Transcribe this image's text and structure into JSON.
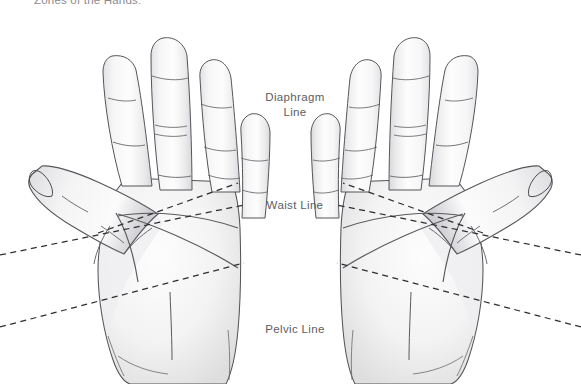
{
  "figure": {
    "caption": "Zones of the Hands:",
    "background_color": "#ffffff",
    "width": 581,
    "height": 384
  },
  "labels": {
    "diaphragm": {
      "line1": "Diaphragm",
      "line2": "Line"
    },
    "waist": {
      "line1": "Waist Line",
      "line2": ""
    },
    "pelvic": {
      "line1": "Pelvic Line",
      "line2": ""
    }
  },
  "style": {
    "label_color": "#5d5d62",
    "caption_color": "#8b8b8f",
    "outline_color": "#4a4a4e",
    "crease_color": "#5a5a5e",
    "dash_color": "#2e2e30",
    "skin_light": "#fdfdfd",
    "skin_mid": "#ededef",
    "skin_shadow": "#d5d5d8"
  },
  "hands": [
    {
      "name": "left-hand",
      "side": "left",
      "view": "palm"
    },
    {
      "name": "right-hand",
      "side": "right",
      "view": "palm"
    }
  ],
  "zone_lines": [
    {
      "name": "diaphragm-line",
      "label": "Diaphragm Line",
      "style": "dashed"
    },
    {
      "name": "waist-line",
      "label": "Waist Line",
      "style": "dashed"
    },
    {
      "name": "pelvic-line",
      "label": "Pelvic Line",
      "style": "dashed"
    }
  ]
}
